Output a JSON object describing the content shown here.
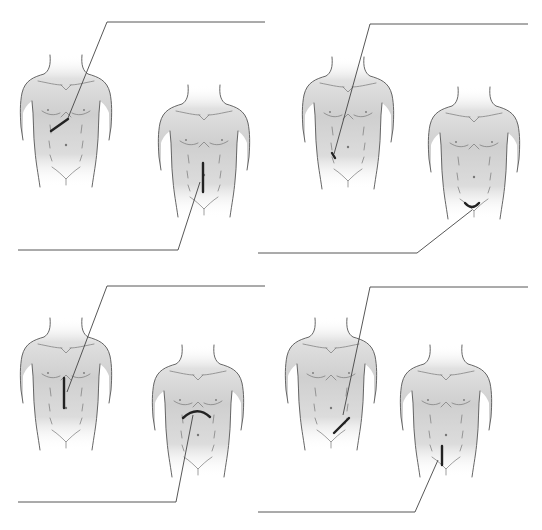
{
  "diagram": {
    "title": "",
    "panels": [
      {
        "id": "panel-1",
        "figures": [
          {
            "id": "torso-a",
            "x": 20,
            "y": 55,
            "incision": "right-subcostal",
            "incision_path": "M 51 131 L 68 119"
          },
          {
            "id": "torso-b",
            "x": 158,
            "y": 85,
            "incision": "right-paramedian",
            "incision_path": "M 203 163 L 203 192"
          }
        ],
        "leaders": [
          "M 68 118 L 107 22 L 265 22",
          "M 200 182 L 178 250 L 18 250"
        ]
      },
      {
        "id": "panel-2",
        "figures": [
          {
            "id": "torso-c",
            "x": 302,
            "y": 57,
            "incision": "mcburney-appendix-point",
            "incision_path": "M 332 153 L 335 158"
          },
          {
            "id": "torso-d",
            "x": 428,
            "y": 87,
            "incision": "pfannenstiel",
            "incision_path": "M 465 203 Q 472 211 479 203"
          }
        ],
        "leaders": [
          "M 334 154 L 370 24 L 528 24",
          "M 472 210 L 417 253 L 258 253"
        ]
      },
      {
        "id": "panel-3",
        "figures": [
          {
            "id": "torso-e",
            "x": 20,
            "y": 318,
            "incision": "upper-midline",
            "incision_path": "M 64 378 L 64 408"
          },
          {
            "id": "torso-f",
            "x": 152,
            "y": 345,
            "incision": "chevron-bilateral-subcostal",
            "incision_path": "M 183 418 Q 197 405 210 417"
          }
        ],
        "leaders": [
          "M 67 392 L 107 286 L 265 286",
          "M 193 415 L 176 502 L 18 502"
        ]
      },
      {
        "id": "panel-4",
        "figures": [
          {
            "id": "torso-g",
            "x": 285,
            "y": 318,
            "incision": "gridiron-right-lower",
            "incision_path": "M 334 433 L 349 418"
          },
          {
            "id": "torso-h",
            "x": 400,
            "y": 345,
            "incision": "lower-midline",
            "incision_path": "M 442 446 L 442 465"
          }
        ],
        "leaders": [
          "M 343 415 L 370 287 L 528 287",
          "M 438 460 L 415 512 L 258 512"
        ]
      }
    ],
    "colors": {
      "skin_shade": "#d4d4d4",
      "outline": "#555555",
      "leader": "#444444",
      "incision": "#222222",
      "background": "#ffffff"
    }
  }
}
